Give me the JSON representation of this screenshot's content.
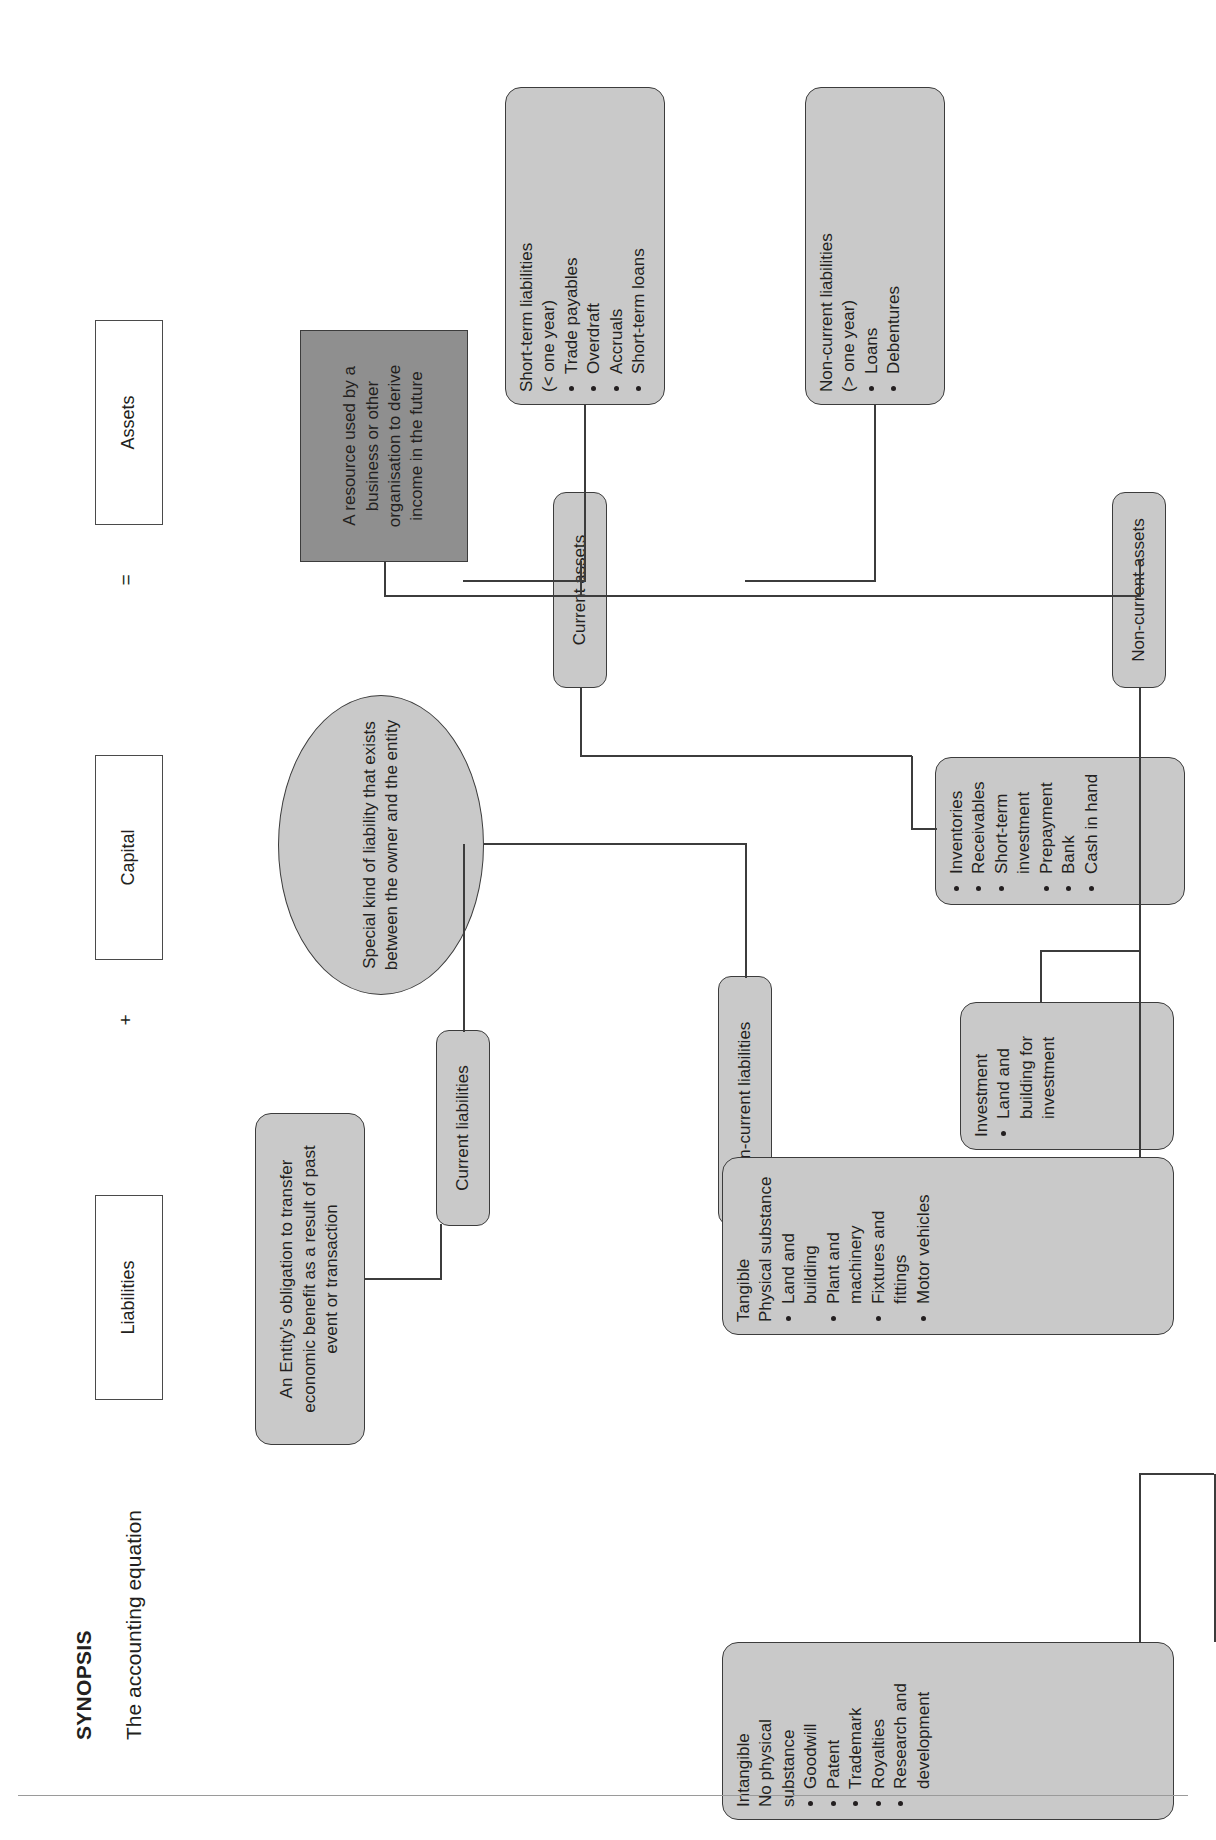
{
  "page": {
    "title": "SYNOPSIS",
    "subtitle": "The accounting equation"
  },
  "equation": {
    "equals": "=",
    "plus": "+",
    "terms": [
      {
        "label": "Assets"
      },
      {
        "label": "Capital"
      },
      {
        "label": "Liabilities"
      }
    ]
  },
  "definitions": {
    "assets": "A resource used by a business or other organisation to derive income in the future",
    "capital": "Special kind of liability that exists between the owner and the entity",
    "liabilities": "An Entity’s obligation to transfer economic benefit as a result of past  event or transaction"
  },
  "branches": {
    "current_assets": "Current assets",
    "non_current_assets": "Non-current assets",
    "current_liabilities": "Current liabilities",
    "non_current_liabilities": "Non-current liabilities"
  },
  "detail_boxes": {
    "current_assets_items": [
      "Inventories",
      "Receivables",
      "Short-term investment",
      "Prepayment",
      "Bank",
      "Cash in hand"
    ],
    "investment": {
      "heading": "Investment",
      "items": [
        "Land and building for investment"
      ]
    },
    "tangible": {
      "heading_line1": "Tangible",
      "heading_line2": "Physical substance",
      "items": [
        "Land and building",
        "Plant and machinery",
        "Fixtures and fittings",
        "Motor vehicles"
      ]
    },
    "intangible": {
      "heading_line1": "Intangible",
      "heading_line2": "No physical substance",
      "items": [
        "Goodwill",
        "Patent",
        "Trademark",
        "Royalties",
        "Research and development"
      ]
    },
    "short_term_liabilities": {
      "heading_line1": "Short-term liabilities",
      "heading_line2": "(< one year)",
      "items": [
        "Trade payables",
        "Overdraft",
        "Accruals",
        "Short-term loans"
      ]
    },
    "non_current_liabilities": {
      "heading_line1": "Non-current liabilities",
      "heading_line2": "(> one year)",
      "items": [
        "Loans",
        "Debentures"
      ]
    }
  },
  "colors": {
    "box_fill": "#c9c9c9",
    "dark_fill": "#8f8f8f",
    "stroke": "#3c3c3c",
    "text": "#231f20"
  }
}
